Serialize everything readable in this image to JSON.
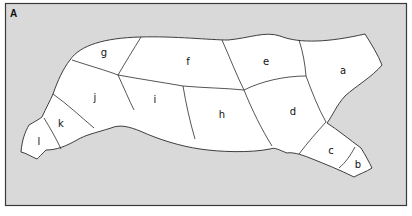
{
  "figure": {
    "panel_label": "A",
    "background_color": "#d9d9d9",
    "region_fill": "#ffffff",
    "line_color": "#2a2a2a"
  },
  "regions": [
    {
      "id": "a",
      "label": "a"
    },
    {
      "id": "b",
      "label": "b"
    },
    {
      "id": "c",
      "label": "c"
    },
    {
      "id": "d",
      "label": "d"
    },
    {
      "id": "e",
      "label": "e"
    },
    {
      "id": "f",
      "label": "f"
    },
    {
      "id": "g",
      "label": "g"
    },
    {
      "id": "h",
      "label": "h"
    },
    {
      "id": "i",
      "label": "i"
    },
    {
      "id": "j",
      "label": "j"
    },
    {
      "id": "k",
      "label": "k"
    },
    {
      "id": "l",
      "label": "l"
    }
  ]
}
